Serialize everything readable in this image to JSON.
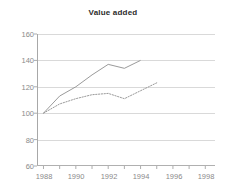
{
  "chart_data": {
    "type": "line",
    "title": "Value added",
    "xlabel": "",
    "ylabel": "",
    "xlim": [
      1987.6,
      1998.6
    ],
    "ylim": [
      60,
      160
    ],
    "grid": true,
    "legend": "none",
    "y_ticks": [
      60,
      80,
      100,
      120,
      140,
      160
    ],
    "x_ticks": [
      1988,
      1989,
      1990,
      1991,
      1992,
      1993,
      1994,
      1995,
      1996,
      1997,
      1998
    ],
    "x_tick_labels": [
      "1988",
      "1990",
      "1992",
      "1994",
      "1996",
      "1998"
    ],
    "x_tick_label_values": [
      1988,
      1990,
      1992,
      1994,
      1996,
      1998
    ],
    "series": [
      {
        "name": "solid-series",
        "style": "solid",
        "color": "#8f8f8f",
        "x": [
          1988,
          1989,
          1990,
          1991,
          1992,
          1993,
          1994
        ],
        "values": [
          100,
          113,
          120,
          129,
          137,
          134,
          140
        ]
      },
      {
        "name": "dotted-series",
        "style": "dotted",
        "color": "#8f8f8f",
        "x": [
          1988,
          1989,
          1990,
          1991,
          1992,
          1993,
          1994,
          1995
        ],
        "values": [
          100,
          107,
          111,
          114,
          115,
          111,
          117,
          123
        ]
      }
    ]
  },
  "axis": {
    "y_labels": [
      "160",
      "140",
      "120",
      "100",
      "80",
      "60"
    ],
    "x_labels": [
      "1988",
      "1990",
      "1992",
      "1994",
      "1996",
      "1998"
    ]
  },
  "colors": {
    "grid": "#d9d9d9",
    "axis": "#a8a8a8",
    "tick_text": "#8a8a8a",
    "title_text": "#2b2b2b",
    "series": "#8f8f8f"
  }
}
